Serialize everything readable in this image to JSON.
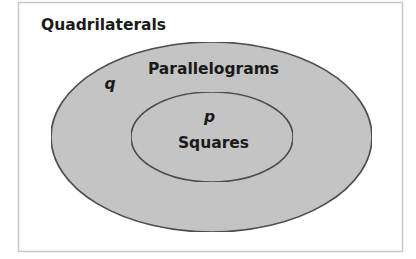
{
  "diagram": {
    "type": "venn-nested",
    "universe": {
      "label": "Quadrilaterals"
    },
    "sets": [
      {
        "id": "outer",
        "label": "Parallelograms",
        "variable": "q"
      },
      {
        "id": "inner",
        "label": "Squares",
        "variable": "p"
      }
    ],
    "relationship": "Squares is a subset of Parallelograms, which is a subset of Quadrilaterals"
  },
  "colors": {
    "background": "#ffffff",
    "frame_stroke": "#c8c8c8",
    "set_fill": "#c4c4c4",
    "set_stroke": "#444444",
    "text": "#1a1a1a"
  }
}
